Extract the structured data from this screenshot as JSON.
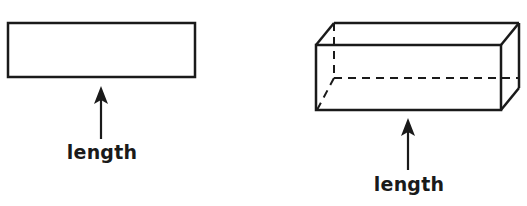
{
  "diagram": {
    "figures": [
      {
        "id": "rectangle",
        "shape": "2D rectangle",
        "arrow_label": "length"
      },
      {
        "id": "rectangular-prism",
        "shape": "3D rectangular prism (hidden edges dashed)",
        "arrow_label": "length"
      }
    ],
    "colors": {
      "stroke": "#1a1a1a",
      "background": "#ffffff"
    }
  }
}
